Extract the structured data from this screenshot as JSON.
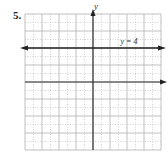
{
  "problem": {
    "number": "5."
  },
  "chart_data": {
    "type": "line",
    "title": "",
    "xlabel": "x",
    "ylabel": "y",
    "xlim": [
      -8,
      8
    ],
    "ylim": [
      -8,
      8
    ],
    "grid": true,
    "series": [
      {
        "name": "y = 4",
        "equation": "y = 4",
        "x": [
          -8,
          8
        ],
        "values": [
          4,
          4
        ]
      }
    ],
    "annotations": [
      {
        "text": "y = 4",
        "x": 3,
        "y": 4.5
      }
    ]
  },
  "labels": {
    "x_axis": "x",
    "y_axis": "y",
    "line": "y = 4"
  },
  "colors": {
    "grid_minor": "#c8c8c8",
    "grid_major": "#b0b0b0",
    "axis": "#333333",
    "line": "#222222"
  }
}
